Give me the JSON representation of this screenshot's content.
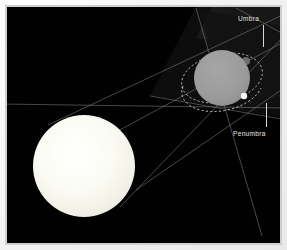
{
  "diagram": {
    "background_color": "#010101",
    "frame_color": "#f2f2f2",
    "labels": [
      {
        "id": "umbra",
        "text": "Umbra",
        "color": "#e8e8e8",
        "x": 238,
        "y": 15
      },
      {
        "id": "penumbra",
        "text": "Penumbra",
        "color": "#e8e8e8",
        "x": 233,
        "y": 130
      }
    ],
    "bodies": [
      {
        "id": "sun",
        "name": "Sun",
        "shape": "circle",
        "cx": 84,
        "cy": 166,
        "r": 51,
        "color": "#f7f7ef"
      },
      {
        "id": "planet",
        "name": "Planet",
        "shape": "circle",
        "cx": 222,
        "cy": 78,
        "r": 28,
        "color": "#9a9a9a"
      },
      {
        "id": "moon",
        "name": "Moon",
        "shape": "circle",
        "cx": 244,
        "cy": 96,
        "r": 3,
        "color": "#f4f4ec"
      },
      {
        "id": "moon-far",
        "name": "Moon far position",
        "shape": "circle",
        "cx": 246,
        "cy": 61,
        "r": 4,
        "color": "#6e6e6e"
      }
    ],
    "orbit": {
      "id": "moon-orbit",
      "name": "Moon orbit",
      "style": "dashed",
      "color": "#cfcfcf",
      "cx": 222,
      "cy": 78,
      "rx": 41,
      "ry": 24,
      "rotation_deg": -12
    },
    "shadow_cones": {
      "umbra_fill": "#1c1c1c",
      "penumbra_fill": "#141414",
      "ray_color": "#8f8f8f"
    },
    "rays": [
      {
        "id": "ray-1",
        "x1": 48,
        "y1": 125,
        "x2": 287,
        "y2": 13
      },
      {
        "id": "ray-2",
        "x1": 34,
        "y1": 176,
        "x2": 287,
        "y2": 40
      },
      {
        "id": "ray-3",
        "x1": 120,
        "y1": 207,
        "x2": 287,
        "y2": 33
      },
      {
        "id": "ray-4",
        "x1": 136,
        "y1": 190,
        "x2": 287,
        "y2": 86
      },
      {
        "id": "ray-5",
        "x1": 0,
        "y1": 104,
        "x2": 287,
        "y2": 108
      },
      {
        "id": "ray-6",
        "x1": 196,
        "y1": 8,
        "x2": 262,
        "y2": 236
      },
      {
        "id": "ray-7",
        "x1": 236,
        "y1": 8,
        "x2": 287,
        "y2": 33
      }
    ]
  }
}
